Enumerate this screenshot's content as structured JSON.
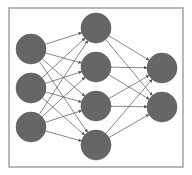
{
  "diagram": {
    "type": "neural-network",
    "frame": {
      "x": 9,
      "y": 8,
      "w": 174,
      "h": 159,
      "stroke": "#8a8a8a"
    },
    "node_color": "#666666",
    "node_stroke": "#555555",
    "edge_color": "#555555",
    "node_radius": 15,
    "layers": [
      {
        "name": "input",
        "x": 31,
        "ys": [
          49,
          88,
          127
        ]
      },
      {
        "name": "hidden",
        "x": 96,
        "ys": [
          28,
          67,
          106,
          145
        ]
      },
      {
        "name": "output",
        "x": 162,
        "ys": [
          68,
          107
        ]
      }
    ]
  }
}
